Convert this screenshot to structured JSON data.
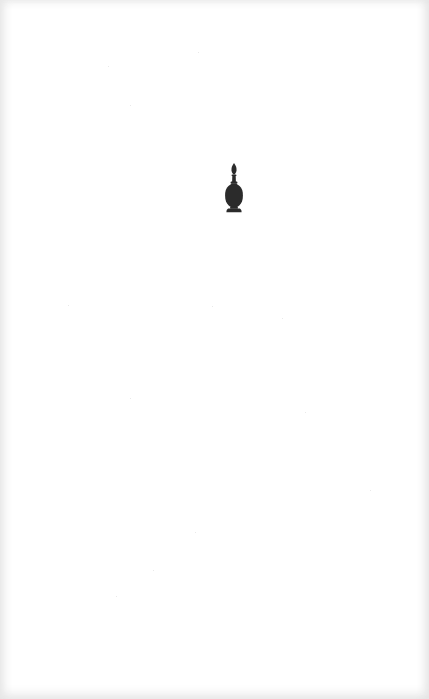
{
  "page": {
    "background_color": "#ffffff",
    "edge_shading_color": "#e6e6e6"
  },
  "vignette": {
    "icon": "perfume-bottle-icon",
    "description": "Decorative ornament: small stoppered scent bottle silhouette",
    "color": "#2b2b2b"
  }
}
